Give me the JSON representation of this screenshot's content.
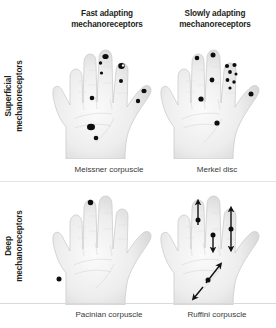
{
  "figure": {
    "title_row_headers": [
      {
        "id": "fast",
        "label": "Fast adapting\nmechanoreceptors",
        "line1": "Fast adapting",
        "line2": "mechanoreceptors"
      },
      {
        "id": "slow",
        "label": "Slowly adapting\nmechanoreceptors",
        "line1": "Slowly adapting",
        "line2": "mechanoreceptors"
      }
    ],
    "row_labels": [
      {
        "id": "superficial",
        "label": "Superficial\nmechanoreceptors",
        "line1": "Superficial",
        "line2": "mechanoreceptors"
      },
      {
        "id": "deep",
        "label": "Deep\nmechanoreceptors",
        "line1": "Deep",
        "line2": "mechanoreceptors"
      }
    ],
    "captions": [
      {
        "id": "meissner",
        "label": "Meissner corpuscle"
      },
      {
        "id": "merkel",
        "label": "Merkel disc"
      },
      {
        "id": "pacinian",
        "label": "Pacinian corpuscle"
      },
      {
        "id": "ruffini",
        "label": "Ruffini corpuscle"
      }
    ],
    "colors": {
      "background": "#ffffff",
      "text": "#231f20",
      "caption_text": "#39393a",
      "receptor_dot": "#0d0d0d",
      "hand_fill_light": "#f7f7f7",
      "hand_fill_mid": "#e6e6e6",
      "hand_fill_shadow": "#cfcfcf",
      "hand_outline": "#c9c9c9",
      "arrow": "#121212"
    },
    "panels": [
      {
        "id": "meissner",
        "receptor": "Meissner corpuscle",
        "row": "Superficial",
        "column": "Fast adapting",
        "marker_style": "filled-dot",
        "marker_count": 12,
        "distribution": "dense at fingertips and distal pads, scattered on palm"
      },
      {
        "id": "merkel",
        "receptor": "Merkel disc",
        "row": "Superficial",
        "column": "Slowly adapting",
        "marker_style": "filled-dot",
        "marker_count": 13,
        "distribution": "clustered on index fingertip, scattered on finger pads and palm"
      },
      {
        "id": "pacinian",
        "receptor": "Pacinian corpuscle",
        "row": "Deep",
        "column": "Fast adapting",
        "marker_style": "filled-dot",
        "marker_count": 2,
        "distribution": "sparse: one middle fingertip, one on ulnar palm"
      },
      {
        "id": "ruffini",
        "receptor": "Ruffini corpuscle",
        "row": "Deep",
        "column": "Slowly adapting",
        "marker_style": "filled-dot-with-double-arrow",
        "marker_count": 4,
        "distribution": "sparse with skin-stretch direction arrows on fingers and thenar eminence"
      }
    ]
  }
}
